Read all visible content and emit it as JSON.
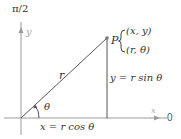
{
  "diagram": {
    "labels": {
      "pole_axis_top": "π/2",
      "y_axis": "y",
      "x_axis": "x",
      "polar_axis_zero": "0",
      "point_name": "P",
      "rect_coords": "(x, y)",
      "polar_coords": "(r, θ)",
      "radius": "r",
      "angle": "θ",
      "x_equation": "x = r cos θ",
      "y_equation": "y = r sin θ"
    },
    "colors": {
      "axis": "#9a9a9a",
      "line": "#555555",
      "text": "#333333",
      "point": "#777777"
    }
  }
}
